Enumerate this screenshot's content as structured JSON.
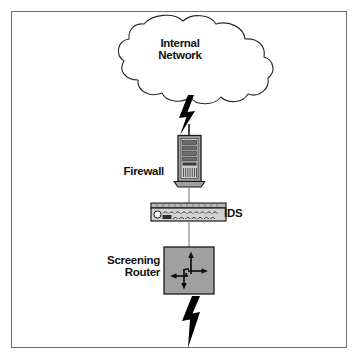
{
  "figure": {
    "type": "network-security-diagram",
    "title_fragment": "g",
    "background_color": "#ffffff",
    "frame_color": "#6e6e6e"
  },
  "colors": {
    "device_fill": "#a0a0a0",
    "device_stroke": "#1a1a1a",
    "link_line": "#8c8c8c",
    "bolt_fill": "#000000",
    "text": "#111111",
    "cloud_stroke": "#2b2b2b",
    "cloud_fill": "#ffffff"
  },
  "nodes": [
    {
      "id": "internal-network",
      "label": "Internal\nNetwork",
      "shape": "cloud",
      "label_position": "inside"
    },
    {
      "id": "firewall",
      "label": "Firewall",
      "shape": "server-tower",
      "label_position": "left"
    },
    {
      "id": "ids",
      "label": "IDS",
      "shape": "rack-appliance",
      "label_position": "right"
    },
    {
      "id": "screening-router",
      "label": "Screening\nRouter",
      "shape": "router-box",
      "label_position": "left"
    }
  ],
  "links": [
    {
      "id": "link-cloud-firewall",
      "from": "internal-network",
      "to": "firewall",
      "style": "lightning-bolt"
    },
    {
      "id": "link-firewall-ids",
      "from": "firewall",
      "to": "ids",
      "style": "line"
    },
    {
      "id": "link-ids-router",
      "from": "ids",
      "to": "screening-router",
      "style": "line"
    },
    {
      "id": "link-router-external",
      "from": "screening-router",
      "to": "external",
      "style": "lightning-bolt"
    }
  ],
  "labels": {
    "internal_network_line1": "Internal",
    "internal_network_line2": "Network",
    "firewall": "Firewall",
    "ids": "IDS",
    "screening_router_line1": "Screening",
    "screening_router_line2": "Router"
  }
}
